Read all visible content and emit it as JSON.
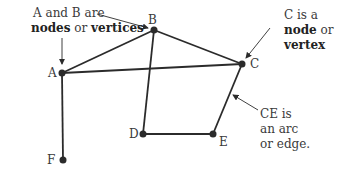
{
  "diagram": {
    "type": "graph",
    "nodes": [
      {
        "id": "A",
        "label": "A",
        "x": 62,
        "y": 73
      },
      {
        "id": "B",
        "label": "B",
        "x": 154,
        "y": 30
      },
      {
        "id": "C",
        "label": "C",
        "x": 242,
        "y": 64
      },
      {
        "id": "D",
        "label": "D",
        "x": 143,
        "y": 134
      },
      {
        "id": "E",
        "label": "E",
        "x": 213,
        "y": 134
      },
      {
        "id": "F",
        "label": "F",
        "x": 63,
        "y": 160
      }
    ],
    "edges": [
      [
        "A",
        "B"
      ],
      [
        "A",
        "C"
      ],
      [
        "B",
        "C"
      ],
      [
        "B",
        "D"
      ],
      [
        "D",
        "E"
      ],
      [
        "C",
        "E"
      ],
      [
        "A",
        "F"
      ]
    ],
    "colors": {
      "line": "#2b2b2b",
      "node": "#2b2b2b",
      "text": "#3a3a3a"
    }
  },
  "annotations": {
    "ab": {
      "line1": "A and B are",
      "bold1": "nodes",
      "mid": " or ",
      "bold2": "vertices"
    },
    "c": {
      "line1": "C is a",
      "bold1": "node",
      "mid": " or",
      "bold2": "vertex"
    },
    "ce": {
      "line1": "CE is",
      "line2": "an arc",
      "line3": "or edge."
    }
  }
}
